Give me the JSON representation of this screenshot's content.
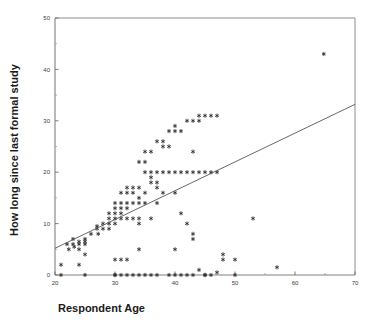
{
  "chart_data": {
    "type": "scatter",
    "title": "",
    "xlabel": "Respondent Age",
    "ylabel": "How long since last formal study",
    "xlim": [
      20,
      70
    ],
    "ylim": [
      0,
      50
    ],
    "xticks": [
      20,
      30,
      40,
      50,
      60,
      70
    ],
    "yticks": [
      0,
      10,
      20,
      30,
      40,
      50
    ],
    "xminorticks": [
      25,
      35,
      45,
      55,
      65
    ],
    "yminorticks": [
      5,
      15,
      25,
      35,
      45
    ],
    "grid": false,
    "legend": null,
    "marker_style": "asterisk",
    "marker_color": "#2b2b2b",
    "line_color": "#555555",
    "axis_color": "#808080",
    "trendline": {
      "label": "linear fit",
      "x": [
        20,
        70
      ],
      "y": [
        5.2,
        33.2
      ]
    },
    "points": [
      [
        21.0,
        2.0
      ],
      [
        21.0,
        0.0
      ],
      [
        22.0,
        6.0
      ],
      [
        22.3,
        5.0
      ],
      [
        23.0,
        7.0
      ],
      [
        23.0,
        6.0
      ],
      [
        23.2,
        5.5
      ],
      [
        24.0,
        6.5
      ],
      [
        24.0,
        6.0
      ],
      [
        24.0,
        5.0
      ],
      [
        24.0,
        2.0
      ],
      [
        25.0,
        7.0
      ],
      [
        25.0,
        6.5
      ],
      [
        25.0,
        6.0
      ],
      [
        25.0,
        4.0
      ],
      [
        25.0,
        0.0
      ],
      [
        26.0,
        8.0
      ],
      [
        27.0,
        9.5
      ],
      [
        27.0,
        9.0
      ],
      [
        27.2,
        8.0
      ],
      [
        28.0,
        10.0
      ],
      [
        28.0,
        9.0
      ],
      [
        29.0,
        12.0
      ],
      [
        29.0,
        11.0
      ],
      [
        29.0,
        10.0
      ],
      [
        29.0,
        9.0
      ],
      [
        30.0,
        14.0
      ],
      [
        30.0,
        13.0
      ],
      [
        30.0,
        12.0
      ],
      [
        30.0,
        11.0
      ],
      [
        30.0,
        10.0
      ],
      [
        30.0,
        3.0
      ],
      [
        30.0,
        0.0
      ],
      [
        30.0,
        0.0
      ],
      [
        31.0,
        16.0
      ],
      [
        31.0,
        14.0
      ],
      [
        31.0,
        13.0
      ],
      [
        31.0,
        12.0
      ],
      [
        31.0,
        11.0
      ],
      [
        31.0,
        3.0
      ],
      [
        31.0,
        0.0
      ],
      [
        32.0,
        17.0
      ],
      [
        32.0,
        16.0
      ],
      [
        32.0,
        14.0
      ],
      [
        32.0,
        13.0
      ],
      [
        32.0,
        11.0
      ],
      [
        32.0,
        3.0
      ],
      [
        32.0,
        0.0
      ],
      [
        33.0,
        17.0
      ],
      [
        33.0,
        16.0
      ],
      [
        33.0,
        14.0
      ],
      [
        33.0,
        11.0
      ],
      [
        33.0,
        0.0
      ],
      [
        34.0,
        22.0
      ],
      [
        34.0,
        17.0
      ],
      [
        34.0,
        15.0
      ],
      [
        34.0,
        14.0
      ],
      [
        34.0,
        11.0
      ],
      [
        34.0,
        10.0
      ],
      [
        34.0,
        5.0
      ],
      [
        34.0,
        0.0
      ],
      [
        35.0,
        24.0
      ],
      [
        35.0,
        22.0
      ],
      [
        35.0,
        20.0
      ],
      [
        35.0,
        16.0
      ],
      [
        35.0,
        14.0
      ],
      [
        35.0,
        0.0
      ],
      [
        36.0,
        24.0
      ],
      [
        36.0,
        20.0
      ],
      [
        36.0,
        19.0
      ],
      [
        36.0,
        18.0
      ],
      [
        36.0,
        11.0
      ],
      [
        36.0,
        0.0
      ],
      [
        37.0,
        26.0
      ],
      [
        37.0,
        20.0
      ],
      [
        37.0,
        18.0
      ],
      [
        37.0,
        17.0
      ],
      [
        37.0,
        14.0
      ],
      [
        37.0,
        0.0
      ],
      [
        38.0,
        26.0
      ],
      [
        38.0,
        25.0
      ],
      [
        38.0,
        20.0
      ],
      [
        38.0,
        16.0
      ],
      [
        39.0,
        28.0
      ],
      [
        39.0,
        25.0
      ],
      [
        39.0,
        20.0
      ],
      [
        39.0,
        0.0
      ],
      [
        40.0,
        29.0
      ],
      [
        40.0,
        28.0
      ],
      [
        40.0,
        20.0
      ],
      [
        40.0,
        16.0
      ],
      [
        40.0,
        5.0
      ],
      [
        40.0,
        0.0
      ],
      [
        41.0,
        28.0
      ],
      [
        41.0,
        20.0
      ],
      [
        41.0,
        12.0
      ],
      [
        41.0,
        0.0
      ],
      [
        42.0,
        30.0
      ],
      [
        42.0,
        20.0
      ],
      [
        42.0,
        10.0
      ],
      [
        42.0,
        0.0
      ],
      [
        43.0,
        30.0
      ],
      [
        43.0,
        24.0
      ],
      [
        43.0,
        20.0
      ],
      [
        43.0,
        8.0
      ],
      [
        43.0,
        7.0
      ],
      [
        43.0,
        0.0
      ],
      [
        44.0,
        31.0
      ],
      [
        44.0,
        30.0
      ],
      [
        44.0,
        20.0
      ],
      [
        44.0,
        1.0
      ],
      [
        45.0,
        31.0
      ],
      [
        45.0,
        20.0
      ],
      [
        45.0,
        0.0
      ],
      [
        45.0,
        0.0
      ],
      [
        46.0,
        31.0
      ],
      [
        46.0,
        20.0
      ],
      [
        46.0,
        0.0
      ],
      [
        47.0,
        31.0
      ],
      [
        47.0,
        20.0
      ],
      [
        47.0,
        0.5
      ],
      [
        48.0,
        4.0
      ],
      [
        48.0,
        3.0
      ],
      [
        50.0,
        3.0
      ],
      [
        50.0,
        0.0
      ],
      [
        53.0,
        11.0
      ],
      [
        57.0,
        1.5
      ],
      [
        64.8,
        43.0
      ]
    ]
  }
}
